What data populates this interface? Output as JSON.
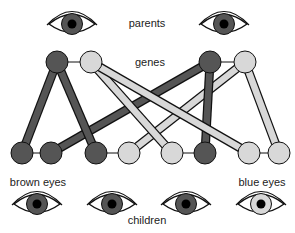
{
  "labels": {
    "parents": "parents",
    "genes": "genes",
    "brown_eyes": "brown eyes",
    "blue_eyes": "blue eyes",
    "children": "children"
  },
  "colors": {
    "dominant": "#555555",
    "recessive": "#d8d8d8",
    "outline": "#111111",
    "pupil": "#000000"
  },
  "parents": [
    {
      "name": "parent-1",
      "eye_color": "brown",
      "genes": [
        "dominant",
        "recessive"
      ]
    },
    {
      "name": "parent-2",
      "eye_color": "brown",
      "genes": [
        "dominant",
        "recessive"
      ]
    }
  ],
  "children": [
    {
      "name": "child-1",
      "eye_color": "brown",
      "genes": [
        "dominant",
        "dominant"
      ]
    },
    {
      "name": "child-2",
      "eye_color": "brown",
      "genes": [
        "dominant",
        "recessive"
      ]
    },
    {
      "name": "child-3",
      "eye_color": "brown",
      "genes": [
        "recessive",
        "dominant"
      ]
    },
    {
      "name": "child-4",
      "eye_color": "blue",
      "genes": [
        "recessive",
        "recessive"
      ]
    }
  ]
}
